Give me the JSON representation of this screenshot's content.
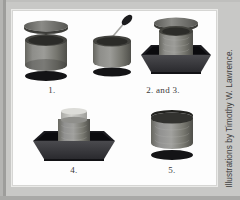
{
  "figure": {
    "panel_name": "illustration-panel",
    "credit": "Illustrations by Timothy W. Lawrence.",
    "steps": [
      {
        "id": "step-1",
        "label": "1.",
        "scene": "open-container-with-lid-above-and-shadow-below"
      },
      {
        "id": "step-23",
        "label": "2. and 3.",
        "scene": "container-inside-dark-tray-with-lid-floating-above"
      },
      {
        "id": "step-4",
        "label": "4.",
        "scene": "container-capped-inside-dark-tray"
      },
      {
        "id": "step-5",
        "label": "5.",
        "scene": "closed-container-with-shadow-below"
      }
    ],
    "tool": {
      "name": "swab-applicator",
      "present_in_step": "1."
    }
  },
  "colors": {
    "mat": "#c8c8c6",
    "mat_edge_dark": "#9d9d9b",
    "panel": "#fdfdfd",
    "panel_border": "#d6d6d4",
    "container_body_light": "#9b9b99",
    "container_body_mid": "#74746f",
    "container_body_dark": "#4e4e4a",
    "container_rim": "#3a3a38",
    "lid_top": "#6e6e6b",
    "lid_top_light": "#8c8c89",
    "tray_dark": "#16161a",
    "tray_front": "#3c3c40",
    "tray_inner": "#0d0d10",
    "shadow": "#1a1a1c",
    "cap_light": "#c2c2bf",
    "tool_handle": "#9a9a97",
    "tool_head": "#1c1c1e",
    "label_text": "#3a3a3a",
    "credit_text": "#3d3d3d"
  }
}
